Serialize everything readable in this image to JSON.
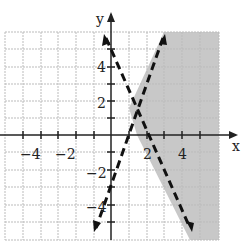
{
  "figure": {
    "x_axis_label": "x",
    "y_axis_label": "y",
    "x_tick_labels": [
      "−4",
      "−2",
      "2",
      "4"
    ],
    "y_tick_labels": [
      "4",
      "2",
      "−2",
      "−4"
    ],
    "xlim": [
      -6,
      6
    ],
    "ylim": [
      -6,
      6
    ],
    "lines": [
      {
        "equation": "y = -3x + 6",
        "style": "dashed"
      },
      {
        "equation": "y = 3x - 3",
        "style": "dashed"
      }
    ],
    "shaded_region": "y > 3x - 3 is false side: region right of both lines",
    "shade_color": "#c8c8c8"
  }
}
